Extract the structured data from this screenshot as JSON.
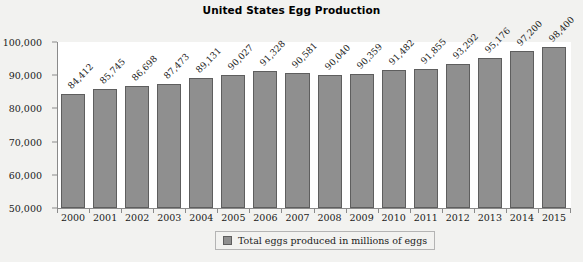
{
  "chart_data": {
    "type": "bar",
    "title": "United States Egg Production",
    "xlabel": "",
    "ylabel": "",
    "ylim": [
      50000,
      100000
    ],
    "ytick_step": 10000,
    "ytick_labels": [
      "50,000",
      "60,000",
      "70,000",
      "80,000",
      "90,000",
      "100,000"
    ],
    "ytick_values": [
      50000,
      60000,
      70000,
      80000,
      90000,
      100000
    ],
    "grid": false,
    "legend_position": "bottom",
    "categories": [
      "2000",
      "2001",
      "2002",
      "2003",
      "2004",
      "2005",
      "2006",
      "2007",
      "2008",
      "2009",
      "2010",
      "2011",
      "2012",
      "2013",
      "2014",
      "2015"
    ],
    "values": [
      84412,
      85745,
      86698,
      87473,
      89131,
      90027,
      91328,
      90581,
      90040,
      90359,
      91482,
      91855,
      93292,
      95176,
      97200,
      98400
    ],
    "value_labels": [
      "84,412",
      "85,745",
      "86,698",
      "87,473",
      "89,131",
      "90,027",
      "91,328",
      "90,581",
      "90,040",
      "90,359",
      "91,482",
      "91,855",
      "93,292",
      "95,176",
      "97,200",
      "98,400"
    ],
    "series": [
      {
        "name": "Total eggs produced in millions of eggs",
        "values": [
          84412,
          85745,
          86698,
          87473,
          89131,
          90027,
          91328,
          90581,
          90040,
          90359,
          91482,
          91855,
          93292,
          95176,
          97200,
          98400
        ],
        "color": "#8f8f8f"
      }
    ],
    "legend": [
      "Total eggs produced in millions of eggs"
    ]
  },
  "colors": {
    "bar_fill": "#8f8f8f",
    "bar_stroke": "#5e5e5e",
    "plot_background": "#ffffff",
    "page_background": "#f2f2f0",
    "axis": "#8a8a8a",
    "text": "#1a1a1a"
  }
}
